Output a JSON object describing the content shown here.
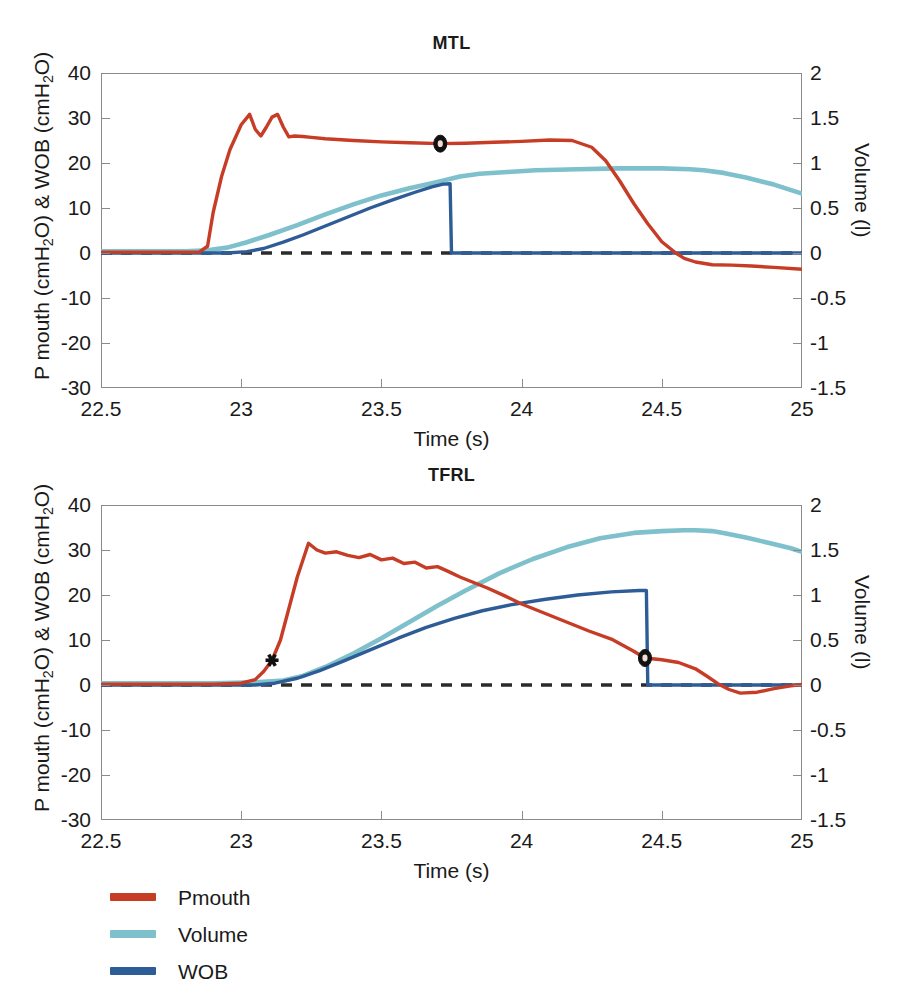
{
  "figure": {
    "xlabel": "Time (s)",
    "ylabel_left": "P mouth (cmH",
    "ylabel_left_sub": "2",
    "ylabel_left_tail": "O) & WOB (cmH",
    "ylabel_left_tail2": "O)",
    "ylabel_right": "Volume (l)"
  },
  "legend": {
    "position": "below-plots",
    "items": [
      {
        "label": "Pmouth",
        "color": "#C63C25"
      },
      {
        "label": "Volume",
        "color": "#7EC0CB"
      },
      {
        "label": "WOB",
        "color": "#2E5C96"
      }
    ]
  },
  "colors": {
    "pmouth": "#C63C25",
    "volume": "#7EC0CB",
    "wob": "#2E5C96",
    "zero_line": "#2b2b2b",
    "axis": "#8a8a8a"
  },
  "chart_data": [
    {
      "type": "line",
      "id": "mtl",
      "title": "MTL",
      "xlabel": "Time (s)",
      "ylabel": "P mouth (cmH2O) & WOB (cmH2O)",
      "ylabel_secondary": "Volume (l)",
      "xlim": [
        22.5,
        25.0
      ],
      "ylim": [
        -30,
        40
      ],
      "ylim_secondary": [
        -1.5,
        2
      ],
      "xticks": [
        "22.5",
        "23",
        "23.5",
        "24",
        "24.5",
        "25"
      ],
      "xtick_values": [
        22.5,
        23,
        23.5,
        24,
        24.5,
        25
      ],
      "yticks": [
        "40",
        "30",
        "20",
        "10",
        "0",
        "-10",
        "-20",
        "-30"
      ],
      "ytick_values": [
        40,
        30,
        20,
        10,
        0,
        -10,
        -20,
        -30
      ],
      "yticks_secondary": [
        "2",
        "1.5",
        "1",
        "0.5",
        "0",
        "-0.5",
        "-1",
        "-1.5"
      ],
      "ytick_values_secondary": [
        2,
        1.5,
        1,
        0.5,
        0,
        -0.5,
        -1,
        -1.5
      ],
      "grid": false,
      "zero_line": {
        "value": 0,
        "style": "dashed",
        "color": "#2b2b2b"
      },
      "annotations": [
        {
          "name": "pmouth-marker",
          "shape": "circle",
          "x": 23.71,
          "y": 24.3,
          "axis": "left"
        }
      ],
      "series": [
        {
          "name": "Pmouth",
          "axis": "left",
          "color": "#C63C25",
          "x": [
            22.5,
            22.7,
            22.85,
            22.88,
            22.9,
            22.93,
            22.96,
            23.0,
            23.03,
            23.05,
            23.07,
            23.09,
            23.11,
            23.13,
            23.15,
            23.17,
            23.19,
            23.22,
            23.25,
            23.3,
            23.4,
            23.5,
            23.6,
            23.71,
            23.8,
            23.9,
            24.0,
            24.1,
            24.18,
            24.25,
            24.3,
            24.35,
            24.4,
            24.45,
            24.5,
            24.55,
            24.58,
            24.62,
            24.68,
            24.75,
            24.82,
            24.9,
            25.0
          ],
          "y": [
            0.2,
            0.2,
            0.2,
            1.5,
            9.0,
            17.0,
            23.0,
            28.5,
            30.8,
            27.5,
            26.0,
            28.0,
            30.2,
            30.8,
            28.0,
            25.8,
            26.0,
            25.9,
            25.7,
            25.4,
            25.0,
            24.7,
            24.5,
            24.3,
            24.4,
            24.6,
            24.8,
            25.1,
            25.0,
            23.5,
            20.5,
            16.0,
            11.0,
            6.5,
            2.5,
            0.0,
            -1.2,
            -2.0,
            -2.6,
            -2.7,
            -2.9,
            -3.2,
            -3.6
          ]
        },
        {
          "name": "Volume",
          "axis": "right",
          "color": "#7EC0CB",
          "x": [
            22.5,
            22.8,
            22.88,
            22.95,
            23.02,
            23.1,
            23.2,
            23.3,
            23.4,
            23.5,
            23.6,
            23.7,
            23.78,
            23.85,
            23.95,
            24.05,
            24.2,
            24.35,
            24.5,
            24.6,
            24.65,
            24.72,
            24.8,
            24.9,
            25.0
          ],
          "y": [
            0.02,
            0.02,
            0.03,
            0.06,
            0.12,
            0.2,
            0.31,
            0.43,
            0.54,
            0.64,
            0.72,
            0.79,
            0.85,
            0.88,
            0.9,
            0.92,
            0.93,
            0.94,
            0.94,
            0.93,
            0.92,
            0.89,
            0.84,
            0.76,
            0.66
          ]
        },
        {
          "name": "WOB",
          "axis": "left",
          "color": "#2E5C96",
          "x": [
            22.5,
            22.95,
            23.02,
            23.08,
            23.15,
            23.22,
            23.3,
            23.38,
            23.46,
            23.54,
            23.62,
            23.68,
            23.72,
            23.745,
            23.75,
            23.8,
            24.0,
            24.3,
            24.6,
            25.0
          ],
          "y": [
            0.0,
            0.0,
            0.3,
            1.0,
            2.4,
            4.0,
            6.0,
            8.0,
            10.0,
            11.8,
            13.5,
            14.7,
            15.3,
            15.4,
            0.0,
            0.0,
            0.0,
            0.0,
            0.0,
            0.0
          ]
        }
      ]
    },
    {
      "type": "line",
      "id": "tfrl",
      "title": "TFRL",
      "xlabel": "Time (s)",
      "ylabel": "P mouth (cmH2O) & WOB (cmH2O)",
      "ylabel_secondary": "Volume (l)",
      "xlim": [
        22.5,
        25.0
      ],
      "ylim": [
        -30,
        40
      ],
      "ylim_secondary": [
        -1.5,
        2
      ],
      "xticks": [
        "22.5",
        "23",
        "23.5",
        "24",
        "24.5",
        "25"
      ],
      "xtick_values": [
        22.5,
        23,
        23.5,
        24,
        24.5,
        25
      ],
      "yticks": [
        "40",
        "30",
        "20",
        "10",
        "0",
        "-10",
        "-20",
        "-30"
      ],
      "ytick_values": [
        40,
        30,
        20,
        10,
        0,
        -10,
        -20,
        -30
      ],
      "yticks_secondary": [
        "2",
        "1.5",
        "1",
        "0.5",
        "0",
        "-0.5",
        "-1",
        "-1.5"
      ],
      "ytick_values_secondary": [
        2,
        1.5,
        1,
        0.5,
        0,
        -0.5,
        -1,
        -1.5
      ],
      "grid": false,
      "zero_line": {
        "value": 0,
        "style": "dashed",
        "color": "#2b2b2b"
      },
      "annotations": [
        {
          "name": "pmouth-start-marker",
          "shape": "star",
          "x": 23.11,
          "y": 5.5,
          "axis": "left"
        },
        {
          "name": "pmouth-marker",
          "shape": "circle",
          "x": 24.44,
          "y": 6.0,
          "axis": "left"
        }
      ],
      "series": [
        {
          "name": "Pmouth",
          "axis": "left",
          "color": "#C63C25",
          "x": [
            22.5,
            22.9,
            23.0,
            23.05,
            23.08,
            23.11,
            23.14,
            23.17,
            23.2,
            23.24,
            23.27,
            23.3,
            23.34,
            23.38,
            23.42,
            23.46,
            23.5,
            23.54,
            23.58,
            23.62,
            23.66,
            23.7,
            23.74,
            23.78,
            23.82,
            23.88,
            23.94,
            24.0,
            24.08,
            24.16,
            24.24,
            24.32,
            24.4,
            24.44,
            24.5,
            24.56,
            24.62,
            24.66,
            24.7,
            24.74,
            24.78,
            24.84,
            24.9,
            24.96,
            25.0
          ],
          "y": [
            0.2,
            0.2,
            0.4,
            1.2,
            3.0,
            5.5,
            10.0,
            17.0,
            24.0,
            31.5,
            30.0,
            29.3,
            29.6,
            28.8,
            28.3,
            29.0,
            27.8,
            28.2,
            27.0,
            27.3,
            26.0,
            26.3,
            25.2,
            24.0,
            23.0,
            21.5,
            19.8,
            18.0,
            16.0,
            14.0,
            12.0,
            10.2,
            7.5,
            6.0,
            5.6,
            5.0,
            3.6,
            2.0,
            0.3,
            -1.0,
            -1.8,
            -1.6,
            -0.8,
            -0.2,
            0.1
          ]
        },
        {
          "name": "Volume",
          "axis": "right",
          "color": "#7EC0CB",
          "x": [
            22.5,
            22.9,
            23.05,
            23.15,
            23.22,
            23.3,
            23.4,
            23.5,
            23.6,
            23.7,
            23.8,
            23.92,
            24.04,
            24.16,
            24.28,
            24.4,
            24.5,
            24.58,
            24.62,
            24.68,
            24.72,
            24.8,
            24.88,
            24.96,
            25.0
          ],
          "y": [
            0.02,
            0.02,
            0.03,
            0.05,
            0.1,
            0.2,
            0.35,
            0.52,
            0.7,
            0.88,
            1.05,
            1.24,
            1.4,
            1.53,
            1.63,
            1.69,
            1.71,
            1.72,
            1.72,
            1.71,
            1.69,
            1.64,
            1.58,
            1.52,
            1.48
          ]
        },
        {
          "name": "WOB",
          "axis": "left",
          "color": "#2E5C96",
          "x": [
            22.5,
            23.05,
            23.12,
            23.2,
            23.28,
            23.36,
            23.46,
            23.56,
            23.66,
            23.76,
            23.86,
            23.96,
            24.08,
            24.2,
            24.32,
            24.42,
            24.445,
            24.45,
            24.5,
            24.7,
            25.0
          ],
          "y": [
            0.0,
            0.0,
            0.4,
            1.5,
            3.2,
            5.2,
            7.8,
            10.4,
            12.8,
            14.8,
            16.5,
            17.8,
            19.0,
            20.0,
            20.7,
            21.0,
            21.0,
            0.0,
            0.0,
            0.0,
            0.0
          ]
        }
      ]
    }
  ]
}
